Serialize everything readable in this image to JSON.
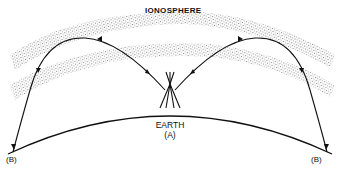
{
  "diagram": {
    "labels": {
      "ionosphere": "IONOSPHERE",
      "earth": "EARTH",
      "transmitter": "(A)",
      "receiver_left": "(B)",
      "receiver_right": "(B)"
    },
    "elements": [
      {
        "id": "ionosphere-band-upper",
        "type": "stippled-band"
      },
      {
        "id": "ionosphere-band-lower",
        "type": "stippled-band"
      },
      {
        "id": "earth-surface",
        "type": "arc"
      },
      {
        "id": "antenna-tower",
        "type": "icon",
        "at": "A"
      },
      {
        "id": "wave-path-left",
        "type": "arrowed-curve",
        "from": "A",
        "to": "B-left"
      },
      {
        "id": "wave-path-right",
        "type": "arrowed-curve",
        "from": "A",
        "to": "B-right"
      }
    ],
    "colors": {
      "line": "#111111",
      "stipple": "#777777",
      "background": "#ffffff"
    }
  }
}
